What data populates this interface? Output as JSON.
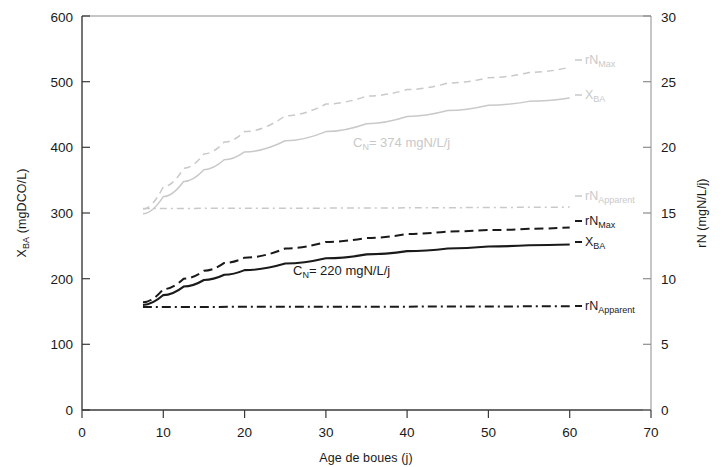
{
  "chart_data": {
    "type": "line",
    "title": "",
    "xlabel": "Age de boues (j)",
    "ylabel": "X",
    "ylabel_sub": "BA",
    "ylabel_unit": " (mgDCO/L)",
    "y2label": "rN (mgN/L/j)",
    "xlim": [
      0,
      70
    ],
    "ylim": [
      0,
      600
    ],
    "y2lim": [
      0,
      30
    ],
    "xticks": [
      "0",
      "10",
      "20",
      "30",
      "40",
      "50",
      "60",
      "70"
    ],
    "yticks": [
      "0",
      "100",
      "200",
      "300",
      "400",
      "500",
      "600"
    ],
    "y2ticks": [
      "0",
      "5",
      "10",
      "15",
      "20",
      "25",
      "30"
    ],
    "grid": false,
    "legend_position": "inline-right",
    "annotations": [
      {
        "text": "C",
        "sub": "N",
        "rest": "= 374 mgN/L/j",
        "x": 28.5,
        "y_axis": "left",
        "y": 398,
        "color": "#c9c9c9"
      },
      {
        "text": "C",
        "sub": "N",
        "rest": "= 220 mgN/L/j",
        "x": 25.5,
        "y_axis": "left",
        "y": 228,
        "color": "#1a1a1a"
      }
    ],
    "series": [
      {
        "name": "rN_Max (C_N=374)",
        "label": "rN",
        "label_sub": "Max",
        "axis": "right",
        "style": "dashed",
        "color": "#c9c9c9",
        "x": [
          7.5,
          10,
          12.5,
          15,
          17.5,
          20,
          25,
          30,
          35,
          40,
          45,
          50,
          55,
          60
        ],
        "values": [
          15.3,
          17.0,
          18.4,
          19.5,
          20.4,
          21.2,
          22.4,
          23.3,
          23.9,
          24.4,
          24.9,
          25.3,
          25.7,
          26.1
        ]
      },
      {
        "name": "X_BA (C_N=374)",
        "label": "X",
        "label_sub": "BA",
        "axis": "left",
        "style": "solid",
        "color": "#c9c9c9",
        "x": [
          7.5,
          10,
          12.5,
          15,
          17.5,
          20,
          25,
          30,
          35,
          40,
          45,
          50,
          55,
          60
        ],
        "values": [
          299,
          325,
          348,
          366,
          381,
          393,
          410,
          424,
          436,
          447,
          456,
          464,
          470,
          475
        ]
      },
      {
        "name": "rN_Apparent (C_N=374)",
        "label": "rN",
        "label_sub": "Apparent",
        "axis": "right",
        "style": "dashdot",
        "color": "#c9c9c9",
        "x": [
          7.5,
          60
        ],
        "values": [
          15.35,
          15.45
        ]
      },
      {
        "name": "rN_Max (C_N=220)",
        "label": "rN",
        "label_sub": "Max",
        "axis": "right",
        "style": "dashed",
        "color": "#1a1a1a",
        "x": [
          7.5,
          10,
          12.5,
          15,
          17.5,
          20,
          25,
          30,
          35,
          40,
          45,
          50,
          55,
          60
        ],
        "values": [
          8.2,
          9.2,
          10.0,
          10.6,
          11.2,
          11.6,
          12.3,
          12.8,
          13.1,
          13.4,
          13.6,
          13.7,
          13.8,
          13.9
        ]
      },
      {
        "name": "X_BA (C_N=220)",
        "label": "X",
        "label_sub": "BA",
        "axis": "left",
        "style": "solid",
        "color": "#1a1a1a",
        "x": [
          7.5,
          10,
          12.5,
          15,
          17.5,
          20,
          25,
          30,
          35,
          40,
          45,
          50,
          55,
          60
        ],
        "values": [
          160,
          175,
          188,
          198,
          206,
          213,
          223,
          231,
          237,
          242,
          246,
          249,
          251,
          252
        ]
      },
      {
        "name": "rN_Apparent (C_N=220)",
        "label": "rN",
        "label_sub": "Apparent",
        "axis": "right",
        "style": "dashdot",
        "color": "#1a1a1a",
        "x": [
          7.5,
          60
        ],
        "values": [
          7.85,
          7.9
        ]
      }
    ]
  },
  "labels": {
    "xaxis_title": "Age de boues (j)",
    "yaxis_main": "X",
    "yaxis_sub": "BA",
    "yaxis_rest": " (mgDCO/L)",
    "y2axis_title": "rN (mgN/L/j)",
    "legend": [
      {
        "main": "rN",
        "sub": "Max",
        "color": "#c9c9c9",
        "style": "dashed"
      },
      {
        "main": "X",
        "sub": "BA",
        "color": "#c9c9c9",
        "style": "solid"
      },
      {
        "main": "rN",
        "sub": "Apparent",
        "color": "#c9c9c9",
        "style": "dashdot"
      },
      {
        "main": "rN",
        "sub": "Max",
        "color": "#1a1a1a",
        "style": "dashed"
      },
      {
        "main": "X",
        "sub": "BA",
        "color": "#1a1a1a",
        "style": "solid"
      },
      {
        "main": "rN",
        "sub": "Apparent",
        "color": "#1a1a1a",
        "style": "dashdot"
      }
    ]
  }
}
